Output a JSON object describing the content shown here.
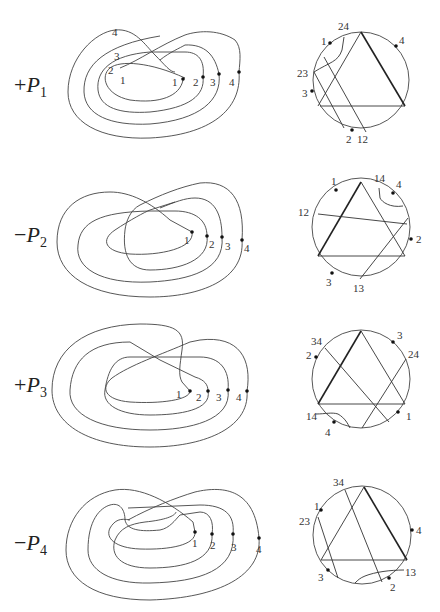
{
  "rows": [
    {
      "label_sign": "+",
      "label_letter": "P",
      "label_sub": "1",
      "knot_labels": {
        "outer4": "4",
        "s3": "3",
        "s2": "2",
        "s1": "1",
        "d1": "1",
        "d2": "2",
        "d3": "3",
        "d4": "4"
      },
      "circle_labels": {
        "a": "24",
        "b": "1",
        "c": "4",
        "d": "23",
        "e": "3",
        "f": "2",
        "g": "12"
      }
    },
    {
      "label_sign": "−",
      "label_letter": "P",
      "label_sub": "2",
      "knot_labels": {
        "d1": "1",
        "d2": "2",
        "d3": "3",
        "d4": "4"
      },
      "circle_labels": {
        "a": "1",
        "b": "14",
        "c": "4",
        "d": "12",
        "e": "2",
        "f": "3",
        "g": "13"
      }
    },
    {
      "label_sign": "+",
      "label_letter": "P",
      "label_sub": "3",
      "knot_labels": {
        "d1": "1",
        "d2": "2",
        "d3": "3",
        "d4": "4"
      },
      "circle_labels": {
        "a": "34",
        "b": "3",
        "c": "2",
        "d": "24",
        "e": "14",
        "f": "1",
        "g": "4"
      }
    },
    {
      "label_sign": "−",
      "label_letter": "P",
      "label_sub": "4",
      "knot_labels": {
        "d1": "1",
        "d2": "2",
        "d3": "3",
        "d4": "4"
      },
      "circle_labels": {
        "a": "34",
        "b": "1",
        "c": "23",
        "d": "4",
        "e": "3",
        "f": "13",
        "g": "2"
      }
    }
  ]
}
